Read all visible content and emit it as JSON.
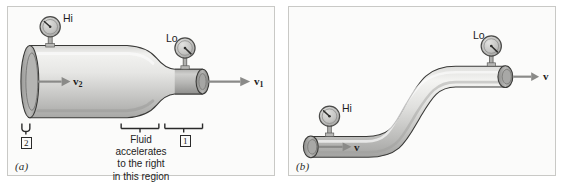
{
  "figure": {
    "background_color": "#ffffff",
    "panel_background_color": "#fbfbfa",
    "panel_border_color": "#c9c9c6",
    "ink_color": "#1d1d1d",
    "pipe_light_color": "#ededeb",
    "pipe_mid_color": "#bfbfbd",
    "pipe_dark_color": "#8e8e8c",
    "pipe_outline_color": "#3a3a38",
    "gauge_face_color": "#c5c5c3",
    "arrow_color": "#8a8a88"
  },
  "panels": [
    {
      "id": "a",
      "caption": "(a)",
      "description": "Converging pipe with a large bore on the left narrowing to a small bore on the right",
      "gauges": [
        {
          "name": "high-pressure-gauge",
          "label": "Hi",
          "reading_state": "high",
          "needle_angle_deg": -55
        },
        {
          "name": "low-pressure-gauge",
          "label": "Lo",
          "reading_state": "low",
          "needle_angle_deg": 35
        }
      ],
      "velocity_labels": [
        {
          "name": "velocity-label-v2",
          "symbol": "v",
          "subscript": "2",
          "location": "large-bore-inlet"
        },
        {
          "name": "velocity-label-v1",
          "symbol": "v",
          "subscript": "1",
          "location": "small-bore-outlet"
        }
      ],
      "station_markers": [
        {
          "name": "station-marker-2",
          "label": "2",
          "location": "large-bore-inlet"
        },
        {
          "name": "station-marker-1",
          "label": "1",
          "location": "small-bore-outlet"
        }
      ],
      "annotation": {
        "name": "acceleration-note",
        "lines": [
          "Fluid",
          "accelerates",
          "to the right",
          "in this region"
        ],
        "text": "Fluid accelerates to the right in this region"
      }
    },
    {
      "id": "b",
      "caption": "(b)",
      "description": "Constant-diameter S-bend pipe rising from lower left to upper right",
      "gauges": [
        {
          "name": "high-pressure-gauge",
          "label": "Hi",
          "reading_state": "high",
          "needle_angle_deg": -55
        },
        {
          "name": "low-pressure-gauge",
          "label": "Lo",
          "reading_state": "low",
          "needle_angle_deg": 35
        }
      ],
      "velocity_labels": [
        {
          "name": "velocity-label-v-inlet",
          "symbol": "v",
          "subscript": "",
          "location": "lower-left-inlet"
        },
        {
          "name": "velocity-label-v-outlet",
          "symbol": "v",
          "subscript": "",
          "location": "upper-right-outlet"
        }
      ],
      "station_markers": [],
      "annotation": null
    }
  ]
}
